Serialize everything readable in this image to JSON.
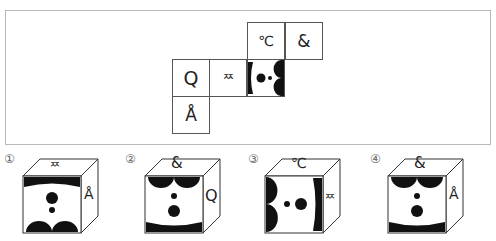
{
  "net": {
    "cells": [
      {
        "id": "celsius",
        "label": "℃"
      },
      {
        "id": "ampersand",
        "label": "&"
      },
      {
        "id": "q",
        "label": "Q"
      },
      {
        "id": "ssang",
        "label": "ᄍ"
      },
      {
        "id": "pattern",
        "label": ""
      },
      {
        "id": "a-ring",
        "label": "Å"
      }
    ]
  },
  "options": [
    {
      "number": "①",
      "top": "ᄍ",
      "right": "Å",
      "front": "pattern (bar top, circles, scallops bottom)"
    },
    {
      "number": "②",
      "top": "&",
      "right": "Q",
      "front": "pattern (scallops top, circles, bar bottom)"
    },
    {
      "number": "③",
      "top": "℃",
      "right": "ᄍ",
      "front": "pattern (scallops left, circles, bar right)"
    },
    {
      "number": "④",
      "top": "&",
      "right": "Å",
      "front": "pattern (scallops top, circles, bar bottom)"
    }
  ]
}
